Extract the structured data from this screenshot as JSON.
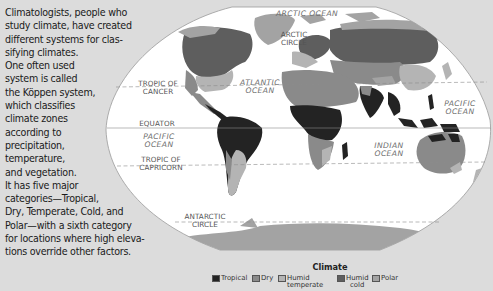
{
  "intro_text_lines": [
    "Climatologists, people who",
    "study climate, have created",
    "different systems for clas-",
    "sifying climates.",
    "One often used",
    "system is called",
    "the Köppen system,",
    "which classifies",
    "climate zones",
    "according to",
    "precipitation,",
    "temperature,",
    "and vegetation.",
    "It has five major",
    "categories—Tropical,",
    "Dry, Temperate, Cold, and",
    "Polar—with a sixth category",
    "for locations where high eleva-",
    "tions override other factors."
  ],
  "map": {
    "labels": {
      "arctic_ocean": "ARCTIC  OCEAN",
      "arctic_circle_1": "ARCTIC",
      "arctic_circle_2": "CIRCLE",
      "tropic_cancer_1": "TROPIC OF",
      "tropic_cancer_2": "CANCER",
      "atlantic_1": "ATLANTIC",
      "atlantic_2": "OCEAN",
      "equator": "EQUATOR",
      "pacific_w_1": "PACIFIC",
      "pacific_w_2": "OCEAN",
      "pacific_e_1": "PACIFIC",
      "pacific_e_2": "OCEAN",
      "tropic_capricorn_1": "TROPIC OF",
      "tropic_capricorn_2": "CAPRICORN",
      "indian_1": "INDIAN",
      "indian_2": "OCEAN",
      "antarctic_circle_1": "ANTARCTIC",
      "antarctic_circle_2": "CIRCLE"
    },
    "colors": {
      "tropical": "#232323",
      "dry": "#8a8a8a",
      "humid_temperate": "#b4b4b4",
      "humid_cold": "#5e5e5e",
      "polar": "#a3a3a3",
      "ocean": "#ffffff",
      "background": "#dcdcdc"
    }
  },
  "legend": {
    "title": "Climate",
    "items": [
      {
        "label": "Tropical",
        "label2": "",
        "color": "#232323"
      },
      {
        "label": "Dry",
        "label2": "",
        "color": "#8a8a8a"
      },
      {
        "label": "Humid",
        "label2": "temperate",
        "color": "#b4b4b4"
      },
      {
        "label": "Humid",
        "label2": "cold",
        "color": "#5e5e5e"
      },
      {
        "label": "Polar",
        "label2": "",
        "color": "#a3a3a3"
      }
    ]
  }
}
